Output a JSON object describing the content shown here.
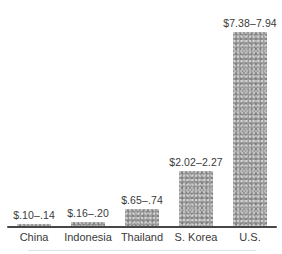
{
  "figure": {
    "background": "#ffffff"
  },
  "chart_data": {
    "type": "bar",
    "title": "",
    "xlabel": "",
    "ylabel": "",
    "categories": [
      "China",
      "Indonesia",
      "Thailand",
      "S. Korea",
      "U.S."
    ],
    "value_labels": [
      "$.10–.14",
      "$.16–.20",
      "$.65–.74",
      "$2.02–2.27",
      "$7.38–7.94"
    ],
    "ranges": [
      [
        0.1,
        0.14
      ],
      [
        0.16,
        0.2
      ],
      [
        0.65,
        0.74
      ],
      [
        2.02,
        2.27
      ],
      [
        7.38,
        7.94
      ]
    ],
    "values_mid": [
      0.12,
      0.18,
      0.695,
      2.145,
      7.66
    ],
    "ylim": [
      0,
      8
    ],
    "grid": false,
    "legend": "none",
    "bar_color": "#9c9c9c",
    "axis_color": "#474747",
    "text_color": "#3a3a3a"
  }
}
